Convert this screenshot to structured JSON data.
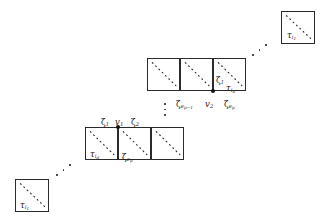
{
  "figure": {
    "kind": "math-diagram",
    "background_color": "#ffffff",
    "stroke_color": "#2b2b2b",
    "width": 324,
    "height": 217
  },
  "blocks": [
    {
      "id": "top-right",
      "squares": [
        {
          "x": 281,
          "y": 11,
          "w": 34,
          "h": 33
        }
      ],
      "inner_labels": [
        {
          "text": "τ",
          "sub": "i",
          "subsub": "1",
          "x": 287,
          "y": 31
        }
      ]
    },
    {
      "id": "middle-row",
      "squares": [
        {
          "x": 147,
          "y": 58,
          "w": 33,
          "h": 33
        },
        {
          "x": 180,
          "y": 58,
          "w": 33,
          "h": 33
        },
        {
          "x": 213,
          "y": 58,
          "w": 33,
          "h": 33
        }
      ],
      "inner_labels": [
        {
          "text": "ζ",
          "sub": "1",
          "x": 216,
          "y": 76
        },
        {
          "text": "τ",
          "sub": "i",
          "subsub": "d",
          "x": 226,
          "y": 84
        }
      ],
      "below_labels": [
        {
          "text": "ζ",
          "sub": "e",
          "subsub": "p−1",
          "x": 176,
          "y": 100
        },
        {
          "text": "v",
          "sub": "2",
          "x": 205,
          "y": 100
        },
        {
          "text": "ζ",
          "sub": "e",
          "subsub": "p",
          "x": 224,
          "y": 100
        }
      ],
      "vertices": [
        {
          "x": 213,
          "y": 91
        }
      ]
    },
    {
      "id": "lower-row",
      "squares": [
        {
          "x": 85,
          "y": 127,
          "w": 33,
          "h": 33
        },
        {
          "x": 118,
          "y": 127,
          "w": 33,
          "h": 33
        },
        {
          "x": 151,
          "y": 127,
          "w": 33,
          "h": 33
        }
      ],
      "inner_labels": [
        {
          "text": "τ",
          "sub": "i",
          "subsub": "d",
          "x": 90,
          "y": 150
        },
        {
          "text": "ζ",
          "sub": "e",
          "subsub": "p",
          "x": 122,
          "y": 153
        }
      ],
      "above_labels": [
        {
          "text": "ζ",
          "sub": "1",
          "x": 101,
          "y": 118
        },
        {
          "text": "v",
          "sub": "1",
          "x": 115,
          "y": 118
        },
        {
          "text": "ζ",
          "sub": "2",
          "x": 131,
          "y": 118
        }
      ],
      "vertices": [
        {
          "x": 118,
          "y": 127
        }
      ]
    },
    {
      "id": "bottom-left",
      "squares": [
        {
          "x": 15,
          "y": 179,
          "w": 34,
          "h": 33
        }
      ],
      "inner_labels": [
        {
          "text": "τ",
          "sub": "i",
          "subsub": "1",
          "x": 20,
          "y": 201
        }
      ]
    }
  ],
  "ellipses": [
    {
      "id": "ellipsis-upper-right",
      "style": "diagonal",
      "x": 252,
      "y": 44
    },
    {
      "id": "ellipsis-lower-left",
      "style": "diagonal",
      "x": 56,
      "y": 164
    },
    {
      "id": "ellipsis-center",
      "style": "vertical",
      "x": 164,
      "y": 103
    }
  ],
  "glyphs": {
    "tau": "τ",
    "zeta": "ζ",
    "vee": "v"
  }
}
